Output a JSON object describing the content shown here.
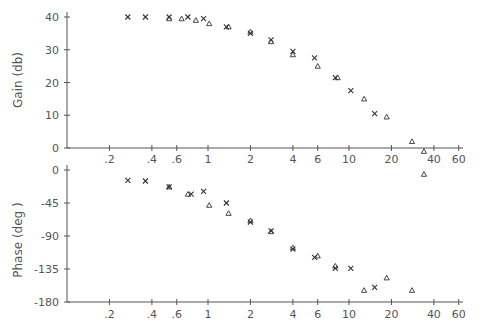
{
  "chart_data": [
    {
      "type": "scatter",
      "title": "",
      "xlabel": "",
      "ylabel": "Gain (db)",
      "xscale": "log",
      "xlim": [
        0.1,
        60
      ],
      "ylim": [
        0,
        40
      ],
      "grid": false,
      "x_ticks": [
        ".2",
        ".4",
        ".6",
        "1",
        "2",
        "4",
        "6",
        "10",
        "20",
        "40",
        "60"
      ],
      "x_tick_values": [
        0.2,
        0.4,
        0.6,
        1,
        2,
        4,
        6,
        10,
        20,
        40,
        60
      ],
      "y_ticks": [
        "0",
        "10",
        "20",
        "30",
        "40"
      ],
      "y_tick_values": [
        0,
        10,
        20,
        30,
        40
      ],
      "series": [
        {
          "name": "measured",
          "marker": "x",
          "points": [
            [
              0.27,
              40
            ],
            [
              0.36,
              40
            ],
            [
              0.53,
              40
            ],
            [
              0.72,
              40
            ],
            [
              0.93,
              39.5
            ],
            [
              1.35,
              37
            ],
            [
              2.0,
              35
            ],
            [
              2.8,
              33
            ],
            [
              4.0,
              29.5
            ],
            [
              5.7,
              27.5
            ],
            [
              8.0,
              21.5
            ],
            [
              10.3,
              17.5
            ],
            [
              15.2,
              10.5
            ]
          ]
        },
        {
          "name": "model",
          "marker": "triangle",
          "points": [
            [
              0.53,
              39.5
            ],
            [
              0.65,
              39.5
            ],
            [
              0.82,
              39
            ],
            [
              1.02,
              38
            ],
            [
              1.4,
              37
            ],
            [
              2.0,
              35.5
            ],
            [
              2.8,
              32.5
            ],
            [
              4.0,
              28.5
            ],
            [
              6.0,
              25
            ],
            [
              8.3,
              21.5
            ],
            [
              12.8,
              15
            ],
            [
              18.5,
              9.5
            ],
            [
              28,
              2
            ],
            [
              34,
              -1
            ],
            [
              34,
              -8
            ]
          ]
        }
      ]
    },
    {
      "type": "scatter",
      "title": "",
      "xlabel": "",
      "ylabel": "Phase (deg )",
      "xscale": "log",
      "xlim": [
        0.1,
        60
      ],
      "ylim": [
        -180,
        0
      ],
      "grid": false,
      "x_ticks": [
        ".2",
        ".4",
        ".6",
        "1",
        "2",
        "4",
        "6",
        "10",
        "20",
        "40",
        "60"
      ],
      "x_tick_values": [
        0.2,
        0.4,
        0.6,
        1,
        2,
        4,
        6,
        10,
        20,
        40,
        60
      ],
      "y_ticks": [
        "0",
        "-45",
        "-90",
        "-135",
        "-180"
      ],
      "y_tick_values": [
        0,
        -45,
        -90,
        -135,
        -180
      ],
      "series": [
        {
          "name": "measured",
          "marker": "x",
          "points": [
            [
              0.27,
              -14
            ],
            [
              0.36,
              -15
            ],
            [
              0.53,
              -23
            ],
            [
              0.76,
              -33
            ],
            [
              0.93,
              -29
            ],
            [
              1.35,
              -45
            ],
            [
              2.0,
              -71
            ],
            [
              2.8,
              -83
            ],
            [
              4.0,
              -108
            ],
            [
              5.7,
              -119
            ],
            [
              8.0,
              -134
            ],
            [
              10.3,
              -134
            ],
            [
              15.2,
              -160
            ]
          ]
        },
        {
          "name": "model",
          "marker": "triangle",
          "points": [
            [
              0.53,
              -23
            ],
            [
              0.72,
              -33
            ],
            [
              1.02,
              -48
            ],
            [
              1.4,
              -59
            ],
            [
              2.0,
              -69
            ],
            [
              2.8,
              -84
            ],
            [
              4.0,
              -106
            ],
            [
              6.0,
              -117
            ],
            [
              8.0,
              -131
            ],
            [
              12.8,
              -164
            ],
            [
              18.5,
              -147
            ],
            [
              28,
              -164
            ]
          ]
        }
      ]
    }
  ],
  "style": {
    "axis_color": "#555555",
    "marker_color": "#333333",
    "label_color": "#555555"
  }
}
